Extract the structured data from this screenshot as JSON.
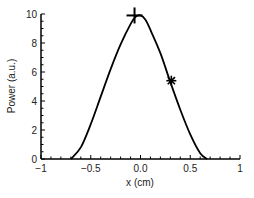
{
  "chart_data": {
    "type": "line",
    "title": "",
    "xlabel": "x (cm)",
    "ylabel": "Power (a.u.)",
    "xlim": [
      -1,
      1
    ],
    "ylim": [
      0,
      10
    ],
    "xticks": [
      "−1",
      "−0.5",
      "0.0",
      "0.5",
      "1"
    ],
    "yticks": [
      "0",
      "2",
      "4",
      "6",
      "8",
      "10"
    ],
    "grid": false,
    "series": [
      {
        "name": "power profile",
        "x": [
          -0.7,
          -0.6,
          -0.5,
          -0.4,
          -0.3,
          -0.2,
          -0.1,
          -0.05,
          0.0,
          0.05,
          0.1,
          0.2,
          0.3,
          0.4,
          0.5,
          0.6,
          0.67
        ],
        "y": [
          0,
          0.8,
          2.4,
          4.3,
          6.2,
          7.9,
          9.3,
          9.8,
          9.9,
          9.6,
          8.9,
          7.3,
          5.3,
          3.4,
          1.7,
          0.4,
          0
        ]
      }
    ],
    "markers": [
      {
        "symbol": "plus",
        "x": -0.06,
        "y": 9.9
      },
      {
        "symbol": "asterisk",
        "x": 0.31,
        "y": 5.4
      }
    ]
  }
}
